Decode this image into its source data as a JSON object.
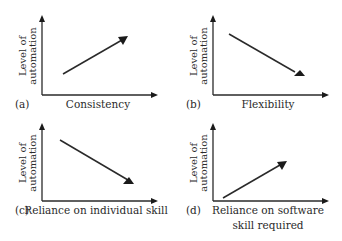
{
  "figure": {
    "panels": [
      {
        "id": "a",
        "tag": "(a)",
        "y_label_line1": "Level of",
        "y_label_line2": "automation",
        "x_label_line1": "Consistency",
        "x_label_line2": "",
        "trend": "increasing"
      },
      {
        "id": "b",
        "tag": "(b)",
        "y_label_line1": "Level of",
        "y_label_line2": "automation",
        "x_label_line1": "Flexibility",
        "x_label_line2": "",
        "trend": "decreasing"
      },
      {
        "id": "c",
        "tag": "(c)",
        "y_label_line1": "Level of",
        "y_label_line2": "automation",
        "x_label_line1": "Reliance on individual skill",
        "x_label_line2": "",
        "trend": "decreasing"
      },
      {
        "id": "d",
        "tag": "(d)",
        "y_label_line1": "Level of",
        "y_label_line2": "automation",
        "x_label_line1": "Reliance on software",
        "x_label_line2": "skill required",
        "trend": "increasing"
      }
    ],
    "colors": {
      "ink": "#2a2a2a",
      "background": "#ffffff"
    }
  }
}
